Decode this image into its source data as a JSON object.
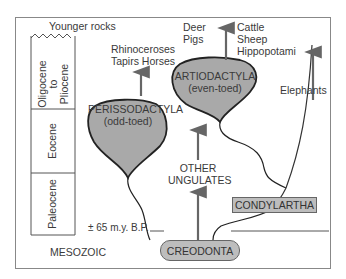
{
  "diagram": {
    "header": "Younger rocks",
    "epochs": {
      "oligocene_pliocene": [
        "Oligocene",
        "to",
        "Pliocene"
      ],
      "eocene": "Eocene",
      "paleocene": "Paleocene"
    },
    "age_marker": "± 65 m.y. B.P.",
    "era_below": "MESOZOIC",
    "nodes": {
      "perissodactyla": {
        "name": "PERISSODACTYLA",
        "desc": "(odd-toed)"
      },
      "artiodactyla": {
        "name": "ARTIODACTYLA",
        "desc": "(even-toed)"
      },
      "other_ungulates": [
        "OTHER",
        "UNGULATES"
      ],
      "condylartha": "CONDYLARTHA",
      "creodonta": "CREODONTA"
    },
    "descendants": {
      "perissodactyla": [
        "Rhinoceroses",
        "Tapirs Horses"
      ],
      "artiodactyla_left": [
        "Deer",
        "Pigs"
      ],
      "artiodactyla_right": [
        "Cattle",
        "Sheep",
        "Hippopotami"
      ],
      "elephants": "Elephants"
    },
    "colors": {
      "fill": "#a9a9a9",
      "box_fill": "#bdbdbd",
      "stroke": "#222222",
      "arrow": "#666666"
    }
  }
}
